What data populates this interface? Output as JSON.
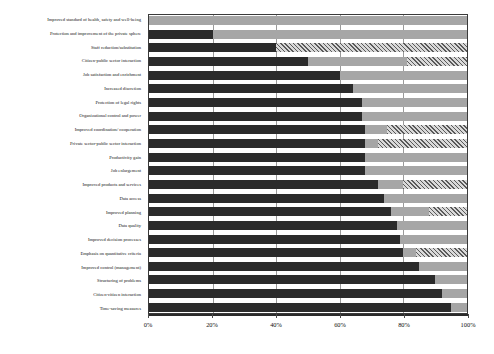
{
  "chart_data": {
    "type": "bar",
    "subtype": "horizontal-100-percent-stacked",
    "title": "",
    "xlabel": "",
    "ylabel": "",
    "xlim": [
      0,
      100
    ],
    "xticks": [
      0,
      20,
      40,
      60,
      80,
      100
    ],
    "xtick_labels": [
      "0%",
      "20%",
      "40%",
      "60%",
      "80%",
      "100%"
    ],
    "grid": true,
    "grid_axis": "x",
    "legend": "none",
    "orientation": "horizontal",
    "bar_order": "top-to-bottom",
    "categories": [
      "Improved standard of health, safety and well-being",
      "Protection and improvement of the private sphere",
      "Staff reduction/substitution",
      "Citizen-public sector interaction",
      "Job satisfaction and enrichment",
      "Increased discretion",
      "Protection of legal rights",
      "Organizational control and power",
      "Improved coordination/ cooperation",
      "Private sector-public sector interaction",
      "Productivity gain",
      "Job enlargement",
      "Improved products and services",
      "Data access",
      "Improved planning",
      "Data quality",
      "Improved decision processes",
      "Emphasis on quantitative criteria",
      "Improved control (management)",
      "Structuring of problems",
      "Citizen-citizen interaction",
      "Time-saving measures"
    ],
    "series": [
      {
        "name": "segment-a",
        "color": "#2b2b2b",
        "pattern": "solid",
        "values": [
          0,
          20,
          40,
          50,
          60,
          64,
          67,
          67,
          68,
          68,
          68,
          68,
          72,
          74,
          76,
          78,
          79,
          80,
          85,
          90,
          92,
          95
        ]
      },
      {
        "name": "segment-b",
        "color": "#a6a6a6",
        "pattern": "solid",
        "values": [
          100,
          80,
          0,
          31,
          40,
          36,
          33,
          33,
          7,
          4,
          32,
          32,
          8,
          26,
          12,
          22,
          21,
          4,
          15,
          10,
          8,
          5
        ]
      },
      {
        "name": "segment-c",
        "color": "#d9d9d9",
        "pattern": "hatched",
        "values": [
          0,
          0,
          60,
          19,
          0,
          0,
          0,
          0,
          25,
          28,
          0,
          0,
          20,
          0,
          12,
          0,
          0,
          16,
          0,
          0,
          0,
          0
        ]
      }
    ]
  },
  "axis": {
    "x_tick_labels": [
      "0%",
      "20%",
      "40%",
      "60%",
      "80%",
      "100%"
    ]
  }
}
